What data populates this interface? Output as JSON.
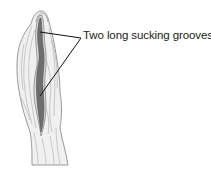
{
  "diagram": {
    "label": "Two long sucking grooves",
    "colors": {
      "background": "#ffffff",
      "body_fill": "#f0f0f0",
      "body_stroke": "#9a9a9a",
      "fold_stroke": "#bdbdbd",
      "groove_fill": "#6e6e6e",
      "groove_stroke": "#555555",
      "leader_line": "#111111",
      "text": "#222222"
    },
    "leader_lines": [
      {
        "from": [
          81,
          38
        ],
        "to": [
          40,
          32
        ]
      },
      {
        "from": [
          81,
          38
        ],
        "to": [
          40,
          96
        ]
      }
    ]
  }
}
